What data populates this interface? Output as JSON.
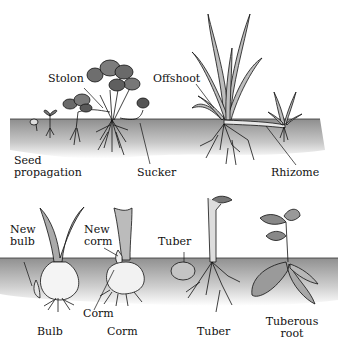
{
  "diagram": {
    "top_panel": {
      "labels": {
        "stolon": "Stolon",
        "offshoot": "Offshoot",
        "seed_propagation_line1": "Seed",
        "seed_propagation_line2": "propagation",
        "sucker": "Sucker",
        "rhizome": "Rhizome"
      }
    },
    "bottom_panel": {
      "labels": {
        "new_bulb_line1": "New",
        "new_bulb_line2": "bulb",
        "new_corm_line1": "New",
        "new_corm_line2": "corm",
        "tuber_pointer": "Tuber",
        "corm_pointer": "Corm",
        "bulb": "Bulb",
        "corm": "Corm",
        "tuber": "Tuber",
        "tuberous_root_line1": "Tuberous",
        "tuberous_root_line2": "root"
      }
    },
    "colors": {
      "soil_dark": "#9a9a9a",
      "soil_light": "#e6e6e6",
      "leaf": "#8a8a8a",
      "outline": "#111111"
    }
  }
}
